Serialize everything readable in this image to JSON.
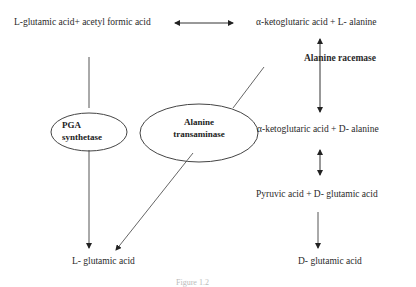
{
  "nodes": {
    "top_left": "L-glutamic acid+ acetyl formic acid",
    "top_right": "α-ketoglutaric acid + L- alanine",
    "mid_right": "α-ketoglutaric acid + D- alanine",
    "lower_right": "Pyruvic acid  + D- glutamic acid",
    "bottom_left": "L- glutamic acid",
    "bottom_right": "D- glutamic acid"
  },
  "enzymes": {
    "racemase": "Alanine racemase",
    "pga_line1": "PGA",
    "pga_line2": "synthetase",
    "transaminase_line1": "Alanine",
    "transaminase_line2": "transaminase"
  },
  "caption": "Figure 1.2"
}
